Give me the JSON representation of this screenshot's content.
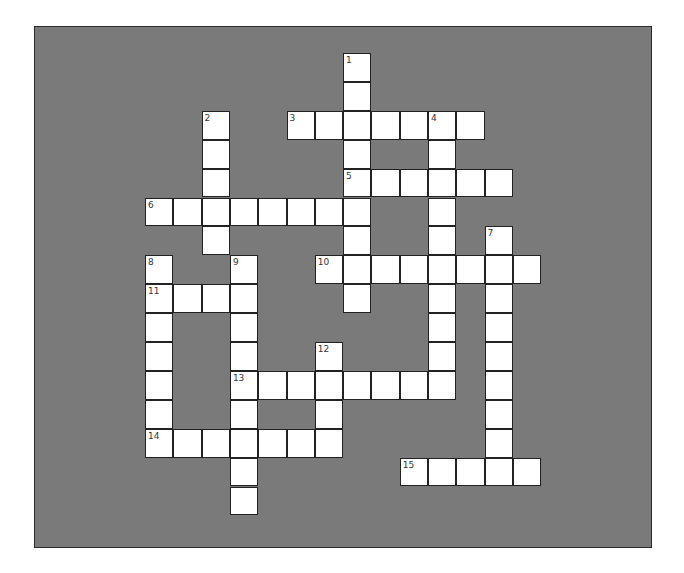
{
  "puzzle": {
    "type": "crossword",
    "colors": {
      "background": "#7a7a7a",
      "cell": "#ffffff",
      "border": "#222222",
      "page": "#ffffff"
    },
    "grid": {
      "origin_x": 145,
      "origin_y": 53,
      "cell_w": 28.3,
      "cell_h": 28.9
    },
    "words": [
      {
        "number": "1",
        "direction": "down",
        "row": 0,
        "col": 7,
        "length": 9
      },
      {
        "number": "2",
        "direction": "down",
        "row": 2,
        "col": 2,
        "length": 5
      },
      {
        "number": "3",
        "direction": "across",
        "row": 2,
        "col": 5,
        "length": 7
      },
      {
        "number": "4",
        "direction": "down",
        "row": 2,
        "col": 10,
        "length": 10
      },
      {
        "number": "5",
        "direction": "across",
        "row": 4,
        "col": 7,
        "length": 6
      },
      {
        "number": "6",
        "direction": "across",
        "row": 5,
        "col": 0,
        "length": 8
      },
      {
        "number": "7",
        "direction": "down",
        "row": 6,
        "col": 12,
        "length": 9
      },
      {
        "number": "8",
        "direction": "down",
        "row": 7,
        "col": 0,
        "length": 7
      },
      {
        "number": "9",
        "direction": "down",
        "row": 7,
        "col": 3,
        "length": 9
      },
      {
        "number": "10",
        "direction": "across",
        "row": 7,
        "col": 6,
        "length": 8
      },
      {
        "number": "11",
        "direction": "across",
        "row": 8,
        "col": 0,
        "length": 4
      },
      {
        "number": "12",
        "direction": "down",
        "row": 10,
        "col": 6,
        "length": 4
      },
      {
        "number": "13",
        "direction": "across",
        "row": 11,
        "col": 3,
        "length": 8
      },
      {
        "number": "14",
        "direction": "across",
        "row": 13,
        "col": 0,
        "length": 7
      },
      {
        "number": "15",
        "direction": "across",
        "row": 14,
        "col": 9,
        "length": 5
      }
    ]
  }
}
